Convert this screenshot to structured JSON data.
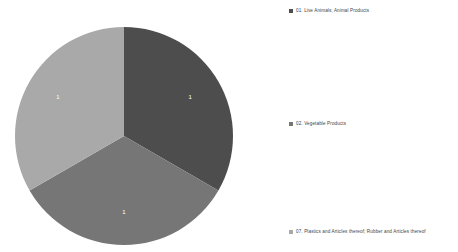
{
  "chart_data": {
    "type": "pie",
    "title": "",
    "categories": [
      "01. Live Animals; Animal Products",
      "02. Vegetable Products",
      "07. Plastics and Articles thereof; Rubber and Articles thereof"
    ],
    "values": [
      1,
      1,
      1
    ],
    "percentages": [
      33.3,
      33.3,
      33.3
    ],
    "data_labels": [
      "1",
      "1",
      "1"
    ],
    "colors": [
      "#4d4d4d",
      "#767676",
      "#a9a9a9"
    ],
    "start_angle_deg": 0,
    "direction": "clockwise",
    "legend_position": "right",
    "grid": false,
    "background": "#ffffff"
  },
  "legend": {
    "items": [
      {
        "label": "01. Live Animals; Animal Products",
        "color": "#4d4d4d"
      },
      {
        "label": "02. Vegetable Products",
        "color": "#767676"
      },
      {
        "label": "07. Plastics and Articles thereof; Rubber and Articles thereof",
        "color": "#a9a9a9"
      }
    ]
  }
}
